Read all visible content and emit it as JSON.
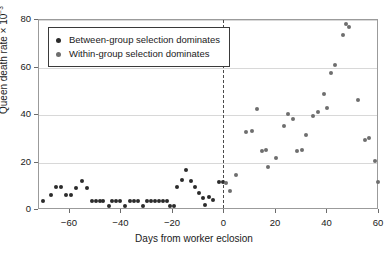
{
  "chart_data": {
    "type": "scatter",
    "title": "",
    "xlabel": "Days from worker eclosion",
    "ylabel": "Queen death rate × 10",
    "ylabel_exponent": "−3",
    "xlim": [
      -72,
      60
    ],
    "ylim": [
      0,
      80
    ],
    "xticks": [
      -60,
      -40,
      -20,
      0,
      20,
      40,
      60
    ],
    "xticklabels": [
      "−60",
      "−40",
      "−20",
      "0",
      "20",
      "40",
      "60"
    ],
    "yticks": [
      0,
      20,
      40,
      60,
      80
    ],
    "yticklabels": [
      "0",
      "20",
      "40",
      "60",
      "80"
    ],
    "grid": "horizontal",
    "legend_position": "upper-left",
    "annotations": [
      {
        "type": "vline",
        "x": -0.5,
        "style": "dashed",
        "color": "#4a4a4a"
      }
    ],
    "series": [
      {
        "name": "Between-group selection dominates",
        "color": "#2b2b2b",
        "points": [
          [
            -70.5,
            3.6
          ],
          [
            -67.5,
            6.4
          ],
          [
            -65.5,
            9.6
          ],
          [
            -63.5,
            9.6
          ],
          [
            -61.5,
            6.2
          ],
          [
            -59.5,
            6.2
          ],
          [
            -57.5,
            9.4
          ],
          [
            -55.5,
            12.2
          ],
          [
            -53.5,
            9.4
          ],
          [
            -51.5,
            3.9
          ],
          [
            -50.0,
            3.9
          ],
          [
            -48.5,
            3.9
          ],
          [
            -47.0,
            3.9
          ],
          [
            -45.0,
            1.7
          ],
          [
            -43.5,
            3.9
          ],
          [
            -42.0,
            3.9
          ],
          [
            -40.5,
            3.9
          ],
          [
            -38.5,
            1.7
          ],
          [
            -36.5,
            3.9
          ],
          [
            -35.0,
            3.9
          ],
          [
            -33.5,
            3.9
          ],
          [
            -31.5,
            1.7
          ],
          [
            -30.0,
            3.9
          ],
          [
            -28.5,
            3.9
          ],
          [
            -27.0,
            3.9
          ],
          [
            -25.5,
            3.9
          ],
          [
            -24.0,
            3.9
          ],
          [
            -22.5,
            3.9
          ],
          [
            -21.0,
            1.7
          ],
          [
            -19.5,
            1.7
          ],
          [
            -18.5,
            9.8
          ],
          [
            -16.5,
            12.6
          ],
          [
            -15.0,
            16.7
          ],
          [
            -13.0,
            12.2
          ],
          [
            -11.5,
            9.8
          ],
          [
            -10.0,
            7.2
          ],
          [
            -8.5,
            5.2
          ],
          [
            -7.5,
            2.0
          ],
          [
            -6.0,
            5.3
          ],
          [
            -4.5,
            4.1
          ],
          [
            -2.0,
            11.6
          ],
          [
            -0.5,
            11.6
          ]
        ]
      },
      {
        "name": "Within-group selection dominates",
        "color": "#6e6e6e",
        "points": [
          [
            0.5,
            11.4
          ],
          [
            2.0,
            7.8
          ],
          [
            4.5,
            14.7
          ],
          [
            8.5,
            32.7
          ],
          [
            10.5,
            33.4
          ],
          [
            12.5,
            42.5
          ],
          [
            14.5,
            24.7
          ],
          [
            16.0,
            25.2
          ],
          [
            17.0,
            18.1
          ],
          [
            20.0,
            22.0
          ],
          [
            23.0,
            35.3
          ],
          [
            24.5,
            40.3
          ],
          [
            26.5,
            38.4
          ],
          [
            28.0,
            25.0
          ],
          [
            30.0,
            25.3
          ],
          [
            31.5,
            31.4
          ],
          [
            34.5,
            39.5
          ],
          [
            36.5,
            41.3
          ],
          [
            38.5,
            48.7
          ],
          [
            40.0,
            43.0
          ],
          [
            41.5,
            57.6
          ],
          [
            43.0,
            61.1
          ],
          [
            46.0,
            73.5
          ],
          [
            47.0,
            78.5
          ],
          [
            48.5,
            77.2
          ],
          [
            52.0,
            46.3
          ],
          [
            54.5,
            29.6
          ],
          [
            56.0,
            30.4
          ],
          [
            58.5,
            20.6
          ],
          [
            59.5,
            11.7
          ]
        ]
      }
    ]
  },
  "legend": {
    "items": [
      {
        "label": "Between-group selection dominates",
        "marker": "dark-circle-marker"
      },
      {
        "label": "Within-group selection dominates",
        "marker": "gray-circle-marker"
      }
    ]
  }
}
